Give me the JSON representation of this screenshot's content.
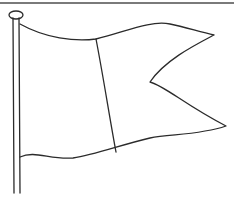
{
  "illustration": {
    "subject": "waving flag on pole",
    "style": "black line drawing on white",
    "colors": {
      "stroke": "#2b2b2b",
      "background": "#ffffff",
      "rule": "#7a7a7a"
    }
  }
}
